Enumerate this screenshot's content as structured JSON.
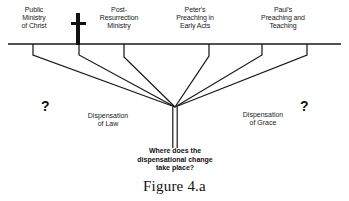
{
  "figure": {
    "caption": "Figure 4.a",
    "background_color": "#ffffff",
    "line_color": "#1a1a1a"
  },
  "timeline": {
    "top_labels": [
      {
        "id": "public-ministry-of-christ",
        "text": "Public\nMinistry\nof Christ",
        "left": 6,
        "width": 56
      },
      {
        "id": "post-resurrection-ministry",
        "text": "Post-\nResurrection\nMinistry",
        "left": 88,
        "width": 62
      },
      {
        "id": "peters-preaching-in-early-acts",
        "text": "Peter's\nPreaching in\nEarly Acts",
        "left": 164,
        "width": 62
      },
      {
        "id": "pauls-preaching-and-teaching",
        "text": "Paul's\nPreaching and\nTeaching",
        "left": 249,
        "width": 68
      }
    ],
    "cross_icon": "cross-icon"
  },
  "annotations": {
    "question_marks": [
      {
        "id": "left-question-mark",
        "text": "?",
        "left": 41,
        "top": 99
      },
      {
        "id": "right-question-mark",
        "text": "?",
        "left": 300,
        "top": 99
      }
    ],
    "dispensations": [
      {
        "id": "dispensation-of-law",
        "text": "Dispensation\nof Law",
        "left": 73,
        "top": 112,
        "width": 70
      },
      {
        "id": "dispensation-of-grace",
        "text": "Dispensation\nof Grace",
        "left": 228,
        "top": 111,
        "width": 70
      }
    ],
    "question_block": "Where does the\ndispensational change\ntake place?"
  },
  "geometry": {
    "baseline": {
      "x1": 8,
      "y1": 44,
      "x2": 341,
      "y2": 44
    },
    "convergence": {
      "x": 175,
      "y": 107
    },
    "stem": {
      "x_left": 172.5,
      "x_right": 177.5,
      "y_top": 107,
      "y_bottom": 148
    },
    "brackets": [
      {
        "id": "bracket-1",
        "x": 33,
        "drop_y": 55
      },
      {
        "id": "bracket-2",
        "x": 79,
        "drop_y": 55
      },
      {
        "id": "bracket-3",
        "x": 124,
        "drop_y": 57
      },
      {
        "id": "bracket-4",
        "x": 209,
        "drop_y": 56
      },
      {
        "id": "bracket-5",
        "x": 262,
        "drop_y": 55
      },
      {
        "id": "bracket-6",
        "x": 307,
        "drop_y": 55
      }
    ]
  }
}
